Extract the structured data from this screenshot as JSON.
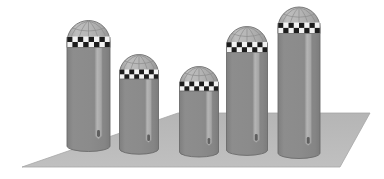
{
  "scene": {
    "title": "Five domed cylindrical pillars on a perspective ground plane",
    "width": 384,
    "height": 179,
    "background_color": "#ffffff",
    "object_count": 5,
    "object_kind": "domed-checkered-pillar"
  },
  "palette": {
    "background": "#ffffff",
    "ground_fill": "#b9b9b9",
    "ground_edge": "#a9a9a9",
    "cylinder_body": "#8b8b8b",
    "cylinder_body_dark": "#828282",
    "cylinder_highlight": "#ababab",
    "cylinder_highlight_edge": "#9a9a9a",
    "dome_fill": "#b2b2b2",
    "dome_rib": "#8f8f8f",
    "dome_outline": "#6e6e6e",
    "checker_dark": "#1c1c1c",
    "checker_light": "#f2f2f2",
    "outline": "#6b6b6b",
    "slot_shadow": "#5f5f5f"
  },
  "ground": {
    "name": "ground-plane",
    "shape": "quadrilateral",
    "points": "22,167 178,113 370,113 340,167",
    "description": "light gray perspective floor"
  },
  "pillars": [
    {
      "id": 1,
      "label": "pillar-1",
      "center_x": 88,
      "width": 43,
      "top_y": 22,
      "base_y": 146,
      "height": 124,
      "dome_height": 20,
      "checker_band_y": 38,
      "checker_band_height": 9,
      "highlight_x": 97,
      "highlight_width": 6,
      "slot_bottom_y": 137
    },
    {
      "id": 2,
      "label": "pillar-2",
      "center_x": 139,
      "width": 39,
      "top_y": 56,
      "base_y": 149,
      "height": 93,
      "dome_height": 18,
      "checker_band_y": 70,
      "checker_band_height": 9,
      "highlight_x": 147,
      "highlight_width": 5,
      "slot_bottom_y": 140
    },
    {
      "id": 3,
      "label": "pillar-3",
      "center_x": 199,
      "width": 39,
      "top_y": 68,
      "base_y": 152,
      "height": 84,
      "dome_height": 18,
      "checker_band_y": 82,
      "checker_band_height": 9,
      "highlight_x": 207,
      "highlight_width": 5,
      "slot_bottom_y": 143
    },
    {
      "id": 4,
      "label": "pillar-4",
      "center_x": 247,
      "width": 41,
      "top_y": 28,
      "base_y": 150,
      "height": 122,
      "dome_height": 19,
      "checker_band_y": 43,
      "checker_band_height": 9,
      "highlight_x": 255,
      "highlight_width": 6,
      "slot_bottom_y": 141
    },
    {
      "id": 5,
      "label": "pillar-5",
      "center_x": 299,
      "width": 42,
      "top_y": 8,
      "base_y": 153,
      "height": 145,
      "dome_height": 20,
      "checker_band_y": 23,
      "checker_band_height": 9,
      "highlight_x": 307,
      "highlight_width": 6,
      "slot_bottom_y": 144
    }
  ],
  "pillar_parts": {
    "dome": "ribbed-dome-cap",
    "band": "black-white-checkered-band",
    "body": "gray-cylinder-body",
    "highlight": "vertical-light-stripe",
    "slot": "vertical-slot-shadow"
  }
}
